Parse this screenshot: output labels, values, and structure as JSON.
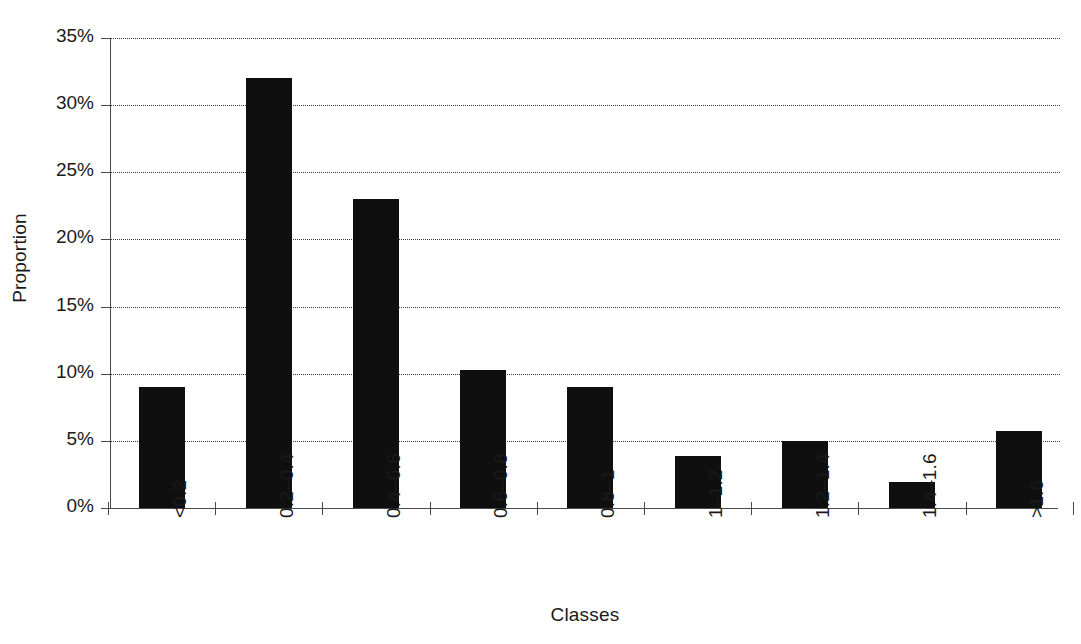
{
  "chart_data": {
    "type": "bar",
    "title": "",
    "subtitle": "",
    "xlabel": "Classes",
    "ylabel": "Proportion",
    "categories": [
      "<0.2",
      "0.2–0.4",
      "0.4–0.6",
      "0.6–0.8",
      "0.8–1",
      "1–1.2",
      "1.2–1.4",
      "1.4–1.6",
      ">1.6"
    ],
    "values": [
      9.0,
      32.0,
      23.0,
      10.3,
      9.0,
      3.9,
      5.0,
      1.9,
      5.7
    ],
    "value_unit": "%",
    "ylim": [
      0,
      35
    ],
    "ytick_values": [
      0,
      5,
      10,
      15,
      20,
      25,
      30,
      35
    ],
    "ytick_labels": [
      "0%",
      "5%",
      "10%",
      "15%",
      "20%",
      "25%",
      "30%",
      "35%"
    ],
    "grid": true,
    "grid_axis": "y",
    "grid_style": "dotted",
    "legend": false,
    "legend_position": "none",
    "bar_color": "#100f0f",
    "axis_color": "#4a4a4a",
    "background_color": "#ffffff",
    "xtick_label_rotation": -90
  },
  "axes": {
    "x_title": "Classes",
    "y_title": "Proportion"
  }
}
